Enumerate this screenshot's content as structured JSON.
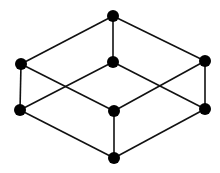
{
  "diagram": {
    "type": "graph",
    "colors": {
      "edge": "#111111",
      "node": "#000000",
      "background": "#ffffff"
    },
    "node_radius": 6,
    "nodes": [
      {
        "id": "top",
        "x": 113,
        "y": 16
      },
      {
        "id": "left-upper",
        "x": 21,
        "y": 64
      },
      {
        "id": "center-upper",
        "x": 113,
        "y": 62
      },
      {
        "id": "right-upper",
        "x": 205,
        "y": 61
      },
      {
        "id": "left-lower",
        "x": 20,
        "y": 110
      },
      {
        "id": "center-lower",
        "x": 114,
        "y": 111
      },
      {
        "id": "right-lower",
        "x": 205,
        "y": 109
      },
      {
        "id": "bottom",
        "x": 114,
        "y": 158
      }
    ],
    "edges": [
      [
        "top",
        "left-upper"
      ],
      [
        "top",
        "right-upper"
      ],
      [
        "top",
        "center-upper"
      ],
      [
        "left-upper",
        "left-lower"
      ],
      [
        "left-upper",
        "center-lower"
      ],
      [
        "right-upper",
        "right-lower"
      ],
      [
        "right-upper",
        "center-lower"
      ],
      [
        "center-upper",
        "left-lower"
      ],
      [
        "center-upper",
        "right-lower"
      ],
      [
        "left-lower",
        "bottom"
      ],
      [
        "right-lower",
        "bottom"
      ],
      [
        "center-lower",
        "bottom"
      ]
    ]
  }
}
